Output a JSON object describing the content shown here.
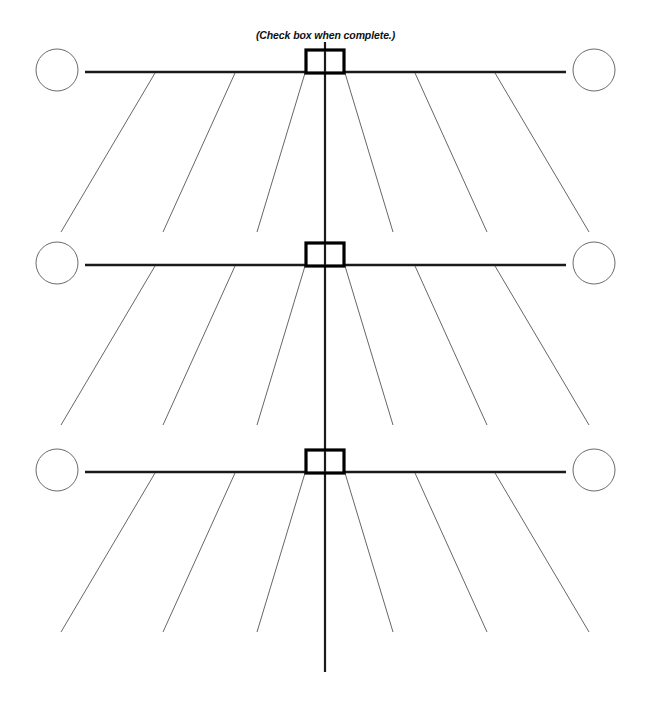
{
  "document": {
    "title": "Fishbone (Cause and Effect) Diagram Worksheet",
    "caption": "(Check box when complete.)",
    "background_color": "#ffffff"
  },
  "styles": {
    "spine_color": "#1a1a1a",
    "rib_color": "#55555a",
    "circle_stroke_color": "#6b6b70",
    "checkbox_stroke_color": "#000000",
    "spine_stroke_width": 2.6,
    "vertical_spine_stroke_width": 2.2,
    "rib_stroke_width": 0.9,
    "circle_stroke_width": 1.0,
    "checkbox_stroke_width": 3.2
  },
  "layout": {
    "canvas_width": 651,
    "canvas_height": 706,
    "center_x": 325,
    "vertical_spine_top_y": 42,
    "vertical_spine_bottom_y": 672,
    "spine_left_x": 85,
    "spine_right_x": 566,
    "circle_radius": 21,
    "circle_left_cx": 57,
    "circle_right_cx": 594,
    "checkbox_width": 38,
    "checkbox_height": 23,
    "rib_length_y": 160,
    "rib_origin_offsets": [
      20,
      90,
      170
    ],
    "rib_x_spread": [
      48,
      72,
      94
    ]
  },
  "sections": [
    {
      "name": "section-1",
      "spine_y": 72,
      "checkbox": {
        "name": "checkbox-1",
        "checked": false,
        "label": "Check box when complete."
      },
      "circle_left": {
        "name": "effect-circle-left-1",
        "value": ""
      },
      "circle_right": {
        "name": "effect-circle-right-1",
        "value": ""
      },
      "rib_count_per_side": 3
    },
    {
      "name": "section-2",
      "spine_y": 265,
      "checkbox": {
        "name": "checkbox-2",
        "checked": false,
        "label": "Check box when complete."
      },
      "circle_left": {
        "name": "effect-circle-left-2",
        "value": ""
      },
      "circle_right": {
        "name": "effect-circle-right-2",
        "value": ""
      },
      "rib_count_per_side": 3
    },
    {
      "name": "section-3",
      "spine_y": 472,
      "checkbox": {
        "name": "checkbox-3",
        "checked": false,
        "label": "Check box when complete."
      },
      "circle_left": {
        "name": "effect-circle-left-3",
        "value": ""
      },
      "circle_right": {
        "name": "effect-circle-right-3",
        "value": ""
      },
      "rib_count_per_side": 3
    }
  ]
}
